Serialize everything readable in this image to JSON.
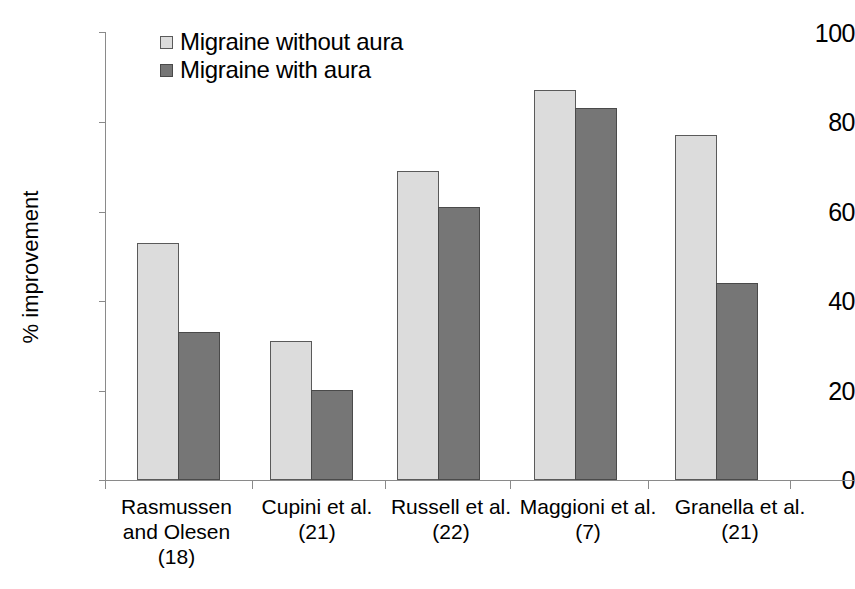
{
  "chart_data": {
    "type": "bar",
    "title": "",
    "xlabel": "",
    "ylabel": "% improvement",
    "ylim": [
      0,
      100
    ],
    "yticks": [
      0,
      20,
      40,
      60,
      80,
      100
    ],
    "grid": false,
    "legend_position": "top-left-inside",
    "categories": [
      "Rasmussen and Olesen (18)",
      "Cupini et al. (21)",
      "Russell et al. (22)",
      "Maggioni et al. (7)",
      "Granella et al. (21)"
    ],
    "category_lines": [
      [
        "Rasmussen",
        "and Olesen",
        "(18)"
      ],
      [
        "Cupini et al.",
        "(21)"
      ],
      [
        "Russell et al.",
        "(22)"
      ],
      [
        "Maggioni et al.",
        "(7)"
      ],
      [
        "Granella et al.",
        "(21)"
      ]
    ],
    "series": [
      {
        "name": "Migraine without aura",
        "color": "#dcdcdc",
        "values": [
          53,
          31,
          69,
          87,
          77
        ]
      },
      {
        "name": "Migraine with aura",
        "color": "#767676",
        "values": [
          33,
          20,
          61,
          83,
          44
        ]
      }
    ]
  },
  "axis": {
    "y_title": "% improvement",
    "y_tick_labels": [
      "100",
      "80",
      "60",
      "40",
      "20",
      "0"
    ]
  },
  "legend": {
    "items": [
      {
        "label": "Migraine without aura",
        "swatch": "light"
      },
      {
        "label": "Migraine with aura",
        "swatch": "dark"
      }
    ]
  }
}
